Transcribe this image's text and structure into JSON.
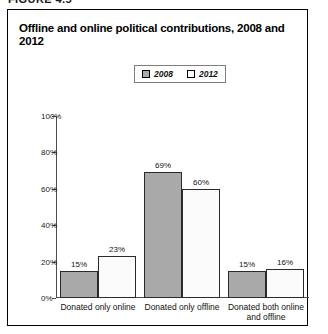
{
  "figure_number": "FIGURE 4.5",
  "panel": {
    "title": "Offline and online political contributions, 2008 and 2012"
  },
  "legend": {
    "position": "top-center",
    "entries": [
      {
        "label": "2008",
        "swatch": "gray-filled-square",
        "color": "#a9a9a9"
      },
      {
        "label": "2012",
        "swatch": "white-square",
        "color": "#ffffff"
      }
    ]
  },
  "chart_data": {
    "type": "bar",
    "title": "Offline and online political contributions, 2008 and 2012",
    "xlabel": "",
    "ylabel": "",
    "ylim": [
      0,
      100
    ],
    "yticks": [
      "0%",
      "20%",
      "40%",
      "60%",
      "80%",
      "100%"
    ],
    "ytick_values": [
      0,
      20,
      40,
      60,
      80,
      100
    ],
    "grid": false,
    "legend_position": "top-center",
    "categories": [
      "Donated only online",
      "Donated only offline",
      "Donated both online\nand offline"
    ],
    "series": [
      {
        "name": "2008",
        "color": "#a9a9a9",
        "values": [
          15,
          69,
          15
        ],
        "labels": [
          "15%",
          "69%",
          "15%"
        ]
      },
      {
        "name": "2012",
        "color": "#ffffff",
        "values": [
          23,
          60,
          16
        ],
        "labels": [
          "23%",
          "60%",
          "16%"
        ]
      }
    ]
  }
}
